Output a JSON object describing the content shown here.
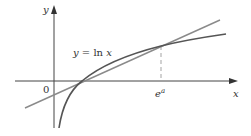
{
  "diagram": {
    "labels": {
      "y_axis": "y",
      "x_axis": "x",
      "origin": "0",
      "curve": "y = ln x",
      "curve_lhs": "y = ",
      "curve_fn": "ln ",
      "curve_var": "x",
      "tick_base": "e",
      "tick_exp": "a"
    },
    "colors": {
      "axis": "#444444",
      "curve": "#555555",
      "line": "#888888",
      "dashed": "#999999",
      "text": "#333333"
    },
    "elements": [
      {
        "type": "axis",
        "name": "x-axis"
      },
      {
        "type": "axis",
        "name": "y-axis"
      },
      {
        "type": "curve",
        "name": "ln-x",
        "equation": "y = ln x"
      },
      {
        "type": "line",
        "name": "secant-tangent-line"
      },
      {
        "type": "dashed-line",
        "name": "vertical-guide-at-e^a"
      }
    ]
  }
}
